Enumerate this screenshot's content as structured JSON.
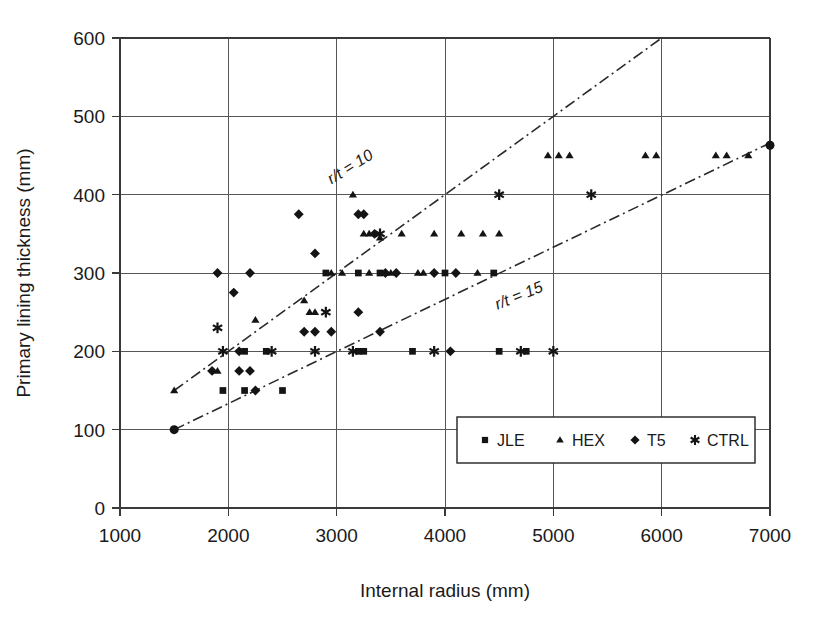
{
  "chart_data": {
    "type": "scatter",
    "title": "",
    "xlabel": "Internal radius (mm)",
    "ylabel": "Primary lining thickness (mm)",
    "xlim": [
      1000,
      7000
    ],
    "ylim": [
      0,
      600
    ],
    "xticks": [
      1000,
      2000,
      3000,
      4000,
      5000,
      6000,
      7000
    ],
    "yticks": [
      0,
      100,
      200,
      300,
      400,
      500,
      600
    ],
    "xtick_labels": [
      "1000",
      "2000",
      "3000",
      "4000",
      "5000",
      "6000",
      "7000"
    ],
    "ytick_labels": [
      "0",
      "100",
      "200",
      "300",
      "400",
      "500",
      "600"
    ],
    "grid": true,
    "legend_position": "lower-right-inside",
    "series": [
      {
        "name": "JLE",
        "marker": "square",
        "points": [
          [
            1950,
            150
          ],
          [
            2150,
            150
          ],
          [
            2500,
            150
          ],
          [
            2150,
            200
          ],
          [
            2350,
            200
          ],
          [
            3200,
            200
          ],
          [
            3250,
            200
          ],
          [
            3700,
            200
          ],
          [
            4500,
            200
          ],
          [
            4750,
            200
          ],
          [
            2900,
            300
          ],
          [
            3200,
            300
          ],
          [
            3400,
            300
          ],
          [
            4000,
            300
          ],
          [
            4450,
            300
          ]
        ]
      },
      {
        "name": "HEX",
        "marker": "triangle",
        "points": [
          [
            1500,
            150
          ],
          [
            1900,
            175
          ],
          [
            2250,
            240
          ],
          [
            2700,
            265
          ],
          [
            2750,
            250
          ],
          [
            2800,
            250
          ],
          [
            3150,
            400
          ],
          [
            3250,
            350
          ],
          [
            3300,
            350
          ],
          [
            3400,
            345
          ],
          [
            3600,
            350
          ],
          [
            3900,
            350
          ],
          [
            4150,
            350
          ],
          [
            4350,
            350
          ],
          [
            4500,
            350
          ],
          [
            2950,
            300
          ],
          [
            3050,
            300
          ],
          [
            3300,
            300
          ],
          [
            3450,
            300
          ],
          [
            3500,
            300
          ],
          [
            3750,
            300
          ],
          [
            3800,
            300
          ],
          [
            4300,
            300
          ],
          [
            4950,
            450
          ],
          [
            5050,
            450
          ],
          [
            5150,
            450
          ],
          [
            5850,
            450
          ],
          [
            5950,
            450
          ],
          [
            6500,
            450
          ],
          [
            6600,
            450
          ],
          [
            6800,
            450
          ]
        ]
      },
      {
        "name": "T5",
        "marker": "diamond",
        "points": [
          [
            1500,
            100
          ],
          [
            1850,
            175
          ],
          [
            1900,
            300
          ],
          [
            2050,
            275
          ],
          [
            2100,
            175
          ],
          [
            2200,
            175
          ],
          [
            2200,
            300
          ],
          [
            2250,
            150
          ],
          [
            2100,
            200
          ],
          [
            2650,
            375
          ],
          [
            2700,
            225
          ],
          [
            2800,
            225
          ],
          [
            2800,
            325
          ],
          [
            2950,
            225
          ],
          [
            3200,
            250
          ],
          [
            3200,
            375
          ],
          [
            3250,
            375
          ],
          [
            3350,
            350
          ],
          [
            3400,
            225
          ],
          [
            3450,
            300
          ],
          [
            3550,
            300
          ],
          [
            3900,
            300
          ],
          [
            4050,
            200
          ],
          [
            4100,
            300
          ],
          [
            7000,
            463
          ]
        ]
      },
      {
        "name": "CTRL",
        "marker": "asterisk",
        "points": [
          [
            1900,
            230
          ],
          [
            1950,
            200
          ],
          [
            2400,
            200
          ],
          [
            2800,
            200
          ],
          [
            2900,
            250
          ],
          [
            3150,
            200
          ],
          [
            3400,
            350
          ],
          [
            3900,
            200
          ],
          [
            4700,
            200
          ],
          [
            5000,
            200
          ],
          [
            4500,
            400
          ],
          [
            5350,
            400
          ]
        ]
      }
    ],
    "annotations": [
      {
        "label": "r/t = 10",
        "line": {
          "x1": 1500,
          "y1": 150,
          "x2": 6000,
          "y2": 600
        },
        "label_x": 3150,
        "label_y": 430,
        "rotation": -32
      },
      {
        "label": "r/t = 15",
        "line": {
          "x1": 1500,
          "y1": 100,
          "x2": 7000,
          "y2": 466
        },
        "label_x": 4700,
        "label_y": 265,
        "rotation": -22
      }
    ],
    "legend_entries": [
      {
        "label": "JLE",
        "marker": "square"
      },
      {
        "label": "HEX",
        "marker": "triangle"
      },
      {
        "label": "T5",
        "marker": "diamond"
      },
      {
        "label": "CTRL",
        "marker": "asterisk"
      }
    ]
  }
}
